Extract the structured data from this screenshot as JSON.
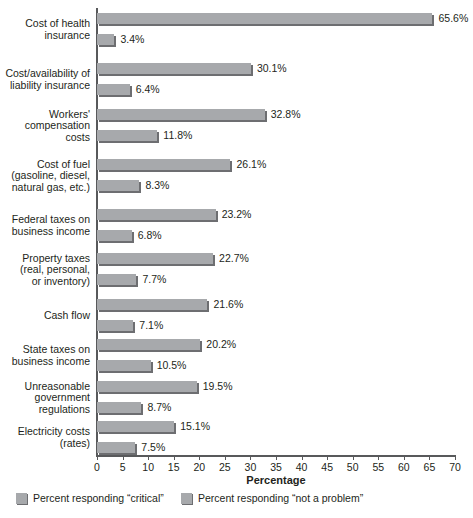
{
  "chart_data": {
    "type": "bar",
    "orientation": "horizontal",
    "title": "",
    "xlabel": "Percentage",
    "ylabel": "",
    "xlim": [
      0,
      70
    ],
    "xticks": [
      0,
      5,
      10,
      15,
      20,
      25,
      30,
      35,
      40,
      45,
      50,
      55,
      60,
      65,
      70
    ],
    "grid": false,
    "legend_position": "bottom",
    "categories": [
      "Cost of health insurance",
      "Cost/availability of liability insurance",
      "Workers' compensation costs",
      "Cost of fuel (gasoline, diesel, natural gas, etc.)",
      "Federal taxes on business income",
      "Property taxes (real, personal, or inventory)",
      "Cash flow",
      "State taxes on business income",
      "Unreasonable government regulations",
      "Electricity costs (rates)"
    ],
    "category_lines": [
      [
        "Cost of health",
        "insurance"
      ],
      [
        "Cost/availability of",
        "liability insurance"
      ],
      [
        "Workers'",
        "compensation",
        "costs"
      ],
      [
        "Cost of fuel",
        "(gasoline, diesel,",
        "natural gas, etc.)"
      ],
      [
        "Federal taxes on",
        "business income"
      ],
      [
        "Property taxes",
        "(real, personal,",
        "or inventory)"
      ],
      [
        "Cash flow"
      ],
      [
        "State taxes on",
        "business income"
      ],
      [
        "Unreasonable",
        "government",
        "regulations"
      ],
      [
        "Electricity costs",
        "(rates)"
      ]
    ],
    "series": [
      {
        "name": "Percent responding \"critical\"",
        "color": "#a7a9ac",
        "values": [
          65.6,
          30.1,
          32.8,
          26.1,
          23.2,
          22.7,
          21.6,
          20.2,
          19.5,
          15.1
        ],
        "labels": [
          "65.6%",
          "30.1%",
          "32.8%",
          "26.1%",
          "23.2%",
          "22.7%",
          "21.6%",
          "20.2%",
          "19.5%",
          "15.1%"
        ]
      },
      {
        "name": "Percent responding \"not a problem\"",
        "color": "#a7a9ac",
        "values": [
          3.4,
          6.4,
          11.8,
          8.3,
          6.8,
          7.7,
          7.1,
          10.5,
          8.7,
          7.5
        ],
        "labels": [
          "3.4%",
          "6.4%",
          "11.8%",
          "8.3%",
          "6.8%",
          "7.7%",
          "7.1%",
          "10.5%",
          "8.7%",
          "7.5%"
        ]
      }
    ]
  },
  "axis": {
    "title": "Percentage",
    "tick_labels": [
      "0",
      "5",
      "10",
      "15",
      "20",
      "25",
      "30",
      "35",
      "40",
      "45",
      "50",
      "55",
      "60",
      "65",
      "70"
    ]
  },
  "legend": {
    "items": [
      {
        "label": "Percent responding “critical”",
        "color": "#a7a9ac"
      },
      {
        "label": "Percent responding “not a problem”",
        "color": "#a7a9ac"
      }
    ]
  },
  "colors": {
    "bar_fill": "#a7a9ac",
    "bar_shadow": "#6d6e71",
    "axis": "#58595b",
    "text": "#231f20",
    "background": "#ffffff"
  }
}
